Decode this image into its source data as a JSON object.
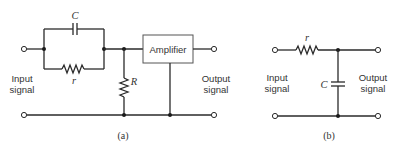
{
  "figure": {
    "panel_a": {
      "caption": "(a)",
      "caption_letter": "a",
      "input_label_line1": "Input",
      "input_label_line2": "signal",
      "output_label_line1": "Output",
      "output_label_line2": "signal",
      "capacitor_label": "C",
      "series_resistor_label": "r",
      "shunt_resistor_label": "R",
      "amplifier_label": "Amplifier"
    },
    "panel_b": {
      "caption": "(b)",
      "input_label_line1": "Input",
      "input_label_line2": "signal",
      "output_label_line1": "Output",
      "output_label_line2": "signal",
      "resistor_label": "r",
      "capacitor_label": "C"
    },
    "colors": {
      "line": "#2a2a2a",
      "text": "#333333",
      "background": "#ffffff"
    }
  }
}
